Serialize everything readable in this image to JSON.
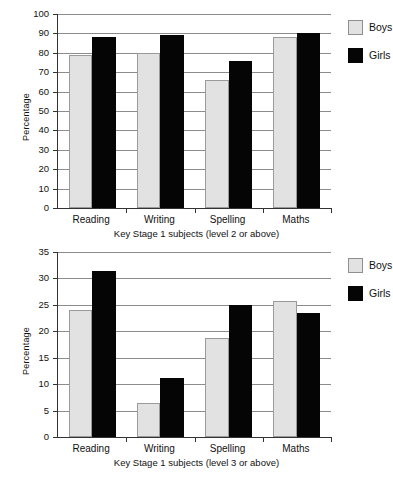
{
  "legend": {
    "position": "right",
    "entries": [
      {
        "label": "Boys",
        "color": "#e2e2e2",
        "swatch": "boys-swatch"
      },
      {
        "label": "Girls",
        "color": "#050505",
        "swatch": "girls-swatch"
      }
    ]
  },
  "chart_data": [
    {
      "id": "key-stage-1-level-2-or-above",
      "type": "bar",
      "title": "",
      "xlabel": "Key Stage 1 subjects (level 2 or above)",
      "ylabel": "Percentage",
      "categories": [
        "Reading",
        "Writing",
        "Spelling",
        "Maths"
      ],
      "series": [
        {
          "name": "Boys",
          "color": "#e2e2e2",
          "values": [
            79,
            80,
            66,
            88
          ]
        },
        {
          "name": "Girls",
          "color": "#050505",
          "values": [
            88,
            89,
            76,
            90
          ]
        }
      ],
      "ylim": [
        0,
        100
      ],
      "yticks": [
        0,
        10,
        20,
        30,
        40,
        50,
        60,
        70,
        80,
        90,
        100
      ],
      "grid": true
    },
    {
      "id": "key-stage-1-level-3-or-above",
      "type": "bar",
      "title": "",
      "xlabel": "Key Stage 1 subjects (level 3 or above)",
      "ylabel": "Percentage",
      "categories": [
        "Reading",
        "Writing",
        "Spelling",
        "Maths"
      ],
      "series": [
        {
          "name": "Boys",
          "color": "#e2e2e2",
          "values": [
            24,
            6.4,
            18.8,
            25.7
          ]
        },
        {
          "name": "Girls",
          "color": "#050505",
          "values": [
            31.5,
            11.2,
            25,
            23.4
          ]
        }
      ],
      "ylim": [
        0,
        35
      ],
      "yticks": [
        0,
        5,
        10,
        15,
        20,
        25,
        30,
        35
      ],
      "grid": true
    }
  ]
}
